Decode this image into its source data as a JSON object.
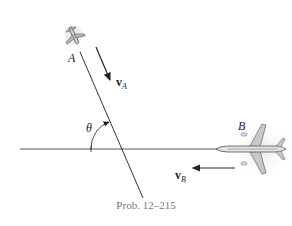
{
  "figure": {
    "caption": "Prob. 12–215",
    "labels": {
      "plane_a": "A",
      "plane_b": "B",
      "velocity_a": "v",
      "velocity_a_sub": "A",
      "velocity_b": "v",
      "velocity_b_sub": "B",
      "angle": "θ"
    },
    "colors": {
      "line": "#333333",
      "plane_fill": "#cfcfcf",
      "plane_stroke": "#555555",
      "caption": "#777777"
    }
  }
}
